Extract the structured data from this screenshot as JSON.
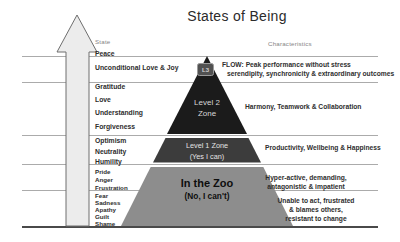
{
  "title": "States of Being",
  "labels": {
    "state": "State",
    "characteristics": "Characteristics"
  },
  "states": {
    "peace": "Peace",
    "unconditional": "Unconditional Love & Joy",
    "gratitude": "Gratitude",
    "love": "Love",
    "understanding": "Understanding",
    "forgiveness": "Forgiveness",
    "optimism": "Optimism",
    "neutrality": "Neutrality",
    "humility": "Humility",
    "pride": "Pride",
    "anger": "Anger",
    "frustration": "Frustration",
    "fear": "Fear",
    "sadness": "Sadness",
    "apathy": "Apathy",
    "guilt": "Guilt",
    "shame": "Shame"
  },
  "pyramid": {
    "badge": "L3",
    "level2": {
      "line1": "Level 2",
      "line2": "Zone",
      "color": "#1b1b1b"
    },
    "level1": {
      "line1": "Level 1 Zone",
      "line2": "(Yes I can)",
      "color": "#3c3c3c"
    },
    "zoo": {
      "line1": "In the Zoo",
      "line2": "(No, I can't)",
      "color": "#8d8d8d"
    }
  },
  "characteristics": {
    "flow": {
      "line1": "FLOW: Peak performance without stress",
      "line2": "serendipity, synchronicity & extraordinary outcomes"
    },
    "harmony": "Harmony, Teamwork & Collaboration",
    "productivity": "Productivity, Wellbeing & Happiness",
    "hyper": {
      "line1": "Hyper-active, demanding,",
      "line2": "antagonistic & impatient"
    },
    "unable": {
      "line1": "Unable to act, frustrated",
      "line2": "& blames others,",
      "line3": "resistant to change"
    }
  }
}
